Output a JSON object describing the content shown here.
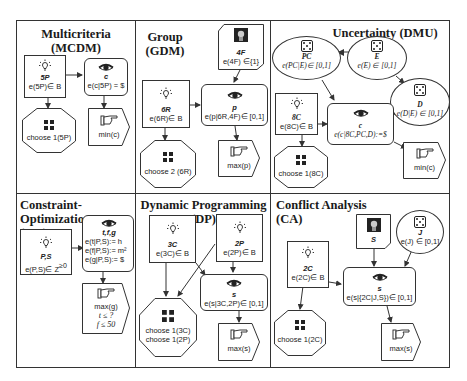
{
  "panels": {
    "mcdm": {
      "title_line1": "Multicriteria",
      "title_line2": "(MCDM)",
      "decision": {
        "label": "5P",
        "expr": "e(5P)∈ B"
      },
      "value": {
        "label": "c",
        "expr": "e(c|5P) = $"
      },
      "choice": {
        "expr": "choose 1(5P)"
      },
      "objective": {
        "expr": "min(c)"
      }
    },
    "gdm": {
      "title_line1": "Group",
      "title_line2": "(GDM)",
      "agent": {
        "label": "4F",
        "expr": "e(4F) ∈{1}"
      },
      "decision": {
        "label": "6R",
        "expr": "e(6R)∈ B"
      },
      "value": {
        "label": "p",
        "expr": "e(p|6R,4F)∈ [0,1]"
      },
      "choice": {
        "expr": "choose 2 (6R)"
      },
      "objective": {
        "expr": "max(p)"
      }
    },
    "dmu": {
      "title": "Uncertainty (DMU)",
      "chance_pc": {
        "label": "PC",
        "expr": "e(PC|E)∈ [0,1]"
      },
      "chance_e": {
        "label": "E",
        "expr": "e(E) ∈ [0,1]"
      },
      "chance_d": {
        "label": "D",
        "expr": "e(D|E) ∈ [0,1]"
      },
      "decision": {
        "label": "8C",
        "expr": "e(8C)∈ B"
      },
      "value": {
        "label": "c",
        "expr": "e(c|8C,PC,D):=$"
      },
      "choice": {
        "expr": "choose 1(8C)"
      },
      "objective": {
        "expr": "min(c)"
      }
    },
    "co": {
      "title_line1": "Constraint-Optimization",
      "title_line2": "(CO)",
      "decision": {
        "label": "P,S",
        "expr": "e(P,S)∈ Z",
        "sup": "≥0"
      },
      "value": {
        "label": "t,f,g",
        "expr1": "e(t|P,S):= h",
        "expr2": "e(f|P,S):= m²",
        "expr3": "e(g|P,S):= $"
      },
      "objective": {
        "expr": "max(g)",
        "c1": "t ≤ ?",
        "c2": "f ≤ 50"
      }
    },
    "dp": {
      "title": "Dynamic Programming (DP)",
      "decision_3c": {
        "label": "3C",
        "expr": "e(3C)∈ B"
      },
      "decision_2p": {
        "label": "2P",
        "expr": "e(2P)∈ B"
      },
      "value": {
        "label": "s",
        "expr": "e(s|3C,2P)∈ [0,1]"
      },
      "choice": {
        "expr1": "choose 1(3C)",
        "expr2": "choose 1(2P)"
      },
      "objective": {
        "expr": "max(s)"
      }
    },
    "ca": {
      "title": "Conflict Analysis (CA)",
      "agent": {
        "label": "S"
      },
      "chance_j": {
        "label": "J",
        "expr": "e(J) ∈ [0,1]"
      },
      "decision": {
        "label": "2C",
        "expr": "e(2C)∈ B"
      },
      "value": {
        "label": "s",
        "expr": "e(s|{2C|J,S})∈ [0,1]"
      },
      "choice": {
        "expr": "choose 1(2C)"
      },
      "objective": {
        "expr": "max(s)"
      }
    }
  },
  "icons": {
    "decision": "lightbulb-icon",
    "value": "eye-icon",
    "objective": "pointing-hand-icon",
    "choice": "four-arrows-icon",
    "chance": "dice-icon",
    "agent": "face-icon"
  },
  "colors": {
    "line": "#333333",
    "background": "#ffffff",
    "text": "#1a1a1a"
  }
}
